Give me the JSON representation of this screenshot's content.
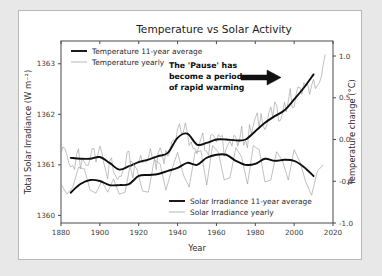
{
  "figure": {
    "title": "Temperature vs Solar Activity",
    "background": "#ffffff",
    "page_background": "#e8e8e8",
    "frame_color": "#b9b9b9"
  },
  "annotation": {
    "line1": "The 'Pause' has",
    "line2": "become a period",
    "line3": "of rapid warming",
    "arrow": "arrow-right",
    "arrow_color": "#111111"
  },
  "legend_top": {
    "items": [
      {
        "label": "Temperature 11-year average",
        "style": "thick",
        "color": "#0f0f0f"
      },
      {
        "label": "Temperature yearly",
        "style": "thin",
        "color": "#9a9a9a"
      }
    ]
  },
  "legend_bottom": {
    "items": [
      {
        "label": "Solar Irradiance 11-year average",
        "style": "thick",
        "color": "#0f0f0f"
      },
      {
        "label": "Solar Irradiance yearly",
        "style": "thin",
        "color": "#9a9a9a"
      }
    ]
  },
  "chart_data": {
    "type": "line",
    "title": "Temperature vs Solar Activity",
    "xlabel": "Year",
    "ylabel": "Total Solar Irradiance (W m$^{-2}$)",
    "ylabel_left": "Total Solar Irradiance (W m⁻²)",
    "ylabel_right": "Temperature change (°C)",
    "grid": false,
    "xlim": [
      1880,
      2020
    ],
    "xticks": [
      1880,
      1900,
      1920,
      1940,
      1960,
      1980,
      2000,
      2020
    ],
    "xticklabels": [
      "1880",
      "1900",
      "1920",
      "1940",
      "1960",
      "1980",
      "2000",
      "2020"
    ],
    "ylim_left": [
      1359.85,
      1363.45
    ],
    "yticks_left": [
      1360,
      1361,
      1362,
      1363
    ],
    "yticklabels_left": [
      "1360",
      "1361",
      "1362",
      "1363"
    ],
    "ylim_right": [
      -1.0,
      1.18
    ],
    "yticks_right": [
      -1.0,
      -0.5,
      0.0,
      0.5,
      1.0
    ],
    "yticklabels_right": [
      "-1.0",
      "-0.5",
      "0.0",
      "0.5",
      "1.0"
    ],
    "legend_position": [
      "upper left",
      "lower right"
    ],
    "series": [
      {
        "name": "Temperature yearly",
        "axis": "right",
        "units": "°C",
        "style": "thin",
        "color": "#9a9a9a",
        "x": [
          1880,
          1881,
          1882,
          1883,
          1884,
          1885,
          1886,
          1887,
          1888,
          1889,
          1890,
          1891,
          1892,
          1893,
          1894,
          1895,
          1896,
          1897,
          1898,
          1899,
          1900,
          1901,
          1902,
          1903,
          1904,
          1905,
          1906,
          1907,
          1908,
          1909,
          1910,
          1911,
          1912,
          1913,
          1914,
          1915,
          1916,
          1917,
          1918,
          1919,
          1920,
          1921,
          1922,
          1923,
          1924,
          1925,
          1926,
          1927,
          1928,
          1929,
          1930,
          1931,
          1932,
          1933,
          1934,
          1935,
          1936,
          1937,
          1938,
          1939,
          1940,
          1941,
          1942,
          1943,
          1944,
          1945,
          1946,
          1947,
          1948,
          1949,
          1950,
          1951,
          1952,
          1953,
          1954,
          1955,
          1956,
          1957,
          1958,
          1959,
          1960,
          1961,
          1962,
          1963,
          1964,
          1965,
          1966,
          1967,
          1968,
          1969,
          1970,
          1971,
          1972,
          1973,
          1974,
          1975,
          1976,
          1977,
          1978,
          1979,
          1980,
          1981,
          1982,
          1983,
          1984,
          1985,
          1986,
          1987,
          1988,
          1989,
          1990,
          1991,
          1992,
          1993,
          1994,
          1995,
          1996,
          1997,
          1998,
          1999,
          2000,
          2001,
          2002,
          2003,
          2004,
          2005,
          2006,
          2007,
          2008,
          2009,
          2010,
          2011,
          2012,
          2013,
          2014,
          2015,
          2016
        ],
        "y": [
          -0.17,
          -0.09,
          -0.11,
          -0.18,
          -0.28,
          -0.33,
          -0.31,
          -0.36,
          -0.18,
          -0.11,
          -0.35,
          -0.23,
          -0.27,
          -0.31,
          -0.31,
          -0.23,
          -0.11,
          -0.11,
          -0.27,
          -0.18,
          -0.08,
          -0.15,
          -0.28,
          -0.37,
          -0.47,
          -0.26,
          -0.22,
          -0.39,
          -0.43,
          -0.48,
          -0.44,
          -0.44,
          -0.36,
          -0.34,
          -0.15,
          -0.14,
          -0.36,
          -0.46,
          -0.29,
          -0.27,
          -0.27,
          -0.19,
          -0.28,
          -0.26,
          -0.27,
          -0.22,
          -0.11,
          -0.22,
          -0.2,
          -0.36,
          -0.16,
          -0.1,
          -0.16,
          -0.29,
          -0.13,
          -0.2,
          -0.15,
          -0.03,
          0.0,
          -0.02,
          0.13,
          0.19,
          0.07,
          0.09,
          0.2,
          0.09,
          -0.07,
          -0.03,
          -0.11,
          -0.11,
          -0.17,
          -0.07,
          0.01,
          0.08,
          -0.13,
          -0.14,
          -0.19,
          0.05,
          0.06,
          0.03,
          -0.03,
          0.06,
          0.03,
          0.05,
          -0.2,
          -0.11,
          -0.06,
          -0.02,
          -0.08,
          0.05,
          0.03,
          -0.08,
          0.01,
          0.16,
          -0.07,
          -0.01,
          -0.1,
          0.18,
          0.07,
          0.17,
          0.26,
          0.32,
          0.14,
          0.31,
          0.16,
          0.12,
          0.18,
          0.32,
          0.39,
          0.27,
          0.45,
          0.41,
          0.22,
          0.23,
          0.31,
          0.45,
          0.33,
          0.46,
          0.61,
          0.38,
          0.39,
          0.54,
          0.63,
          0.62,
          0.54,
          0.68,
          0.64,
          0.66,
          0.54,
          0.65,
          0.72,
          0.61,
          0.65,
          0.68,
          0.75,
          0.9,
          1.02
        ]
      },
      {
        "name": "Temperature 11-year average",
        "axis": "right",
        "units": "°C",
        "style": "thick",
        "color": "#0f0f0f",
        "x": [
          1885,
          1890,
          1895,
          1900,
          1905,
          1910,
          1915,
          1920,
          1925,
          1930,
          1935,
          1940,
          1945,
          1950,
          1955,
          1960,
          1965,
          1970,
          1975,
          1980,
          1985,
          1990,
          1995,
          2000,
          2005,
          2010
        ],
        "y": [
          -0.22,
          -0.23,
          -0.23,
          -0.21,
          -0.28,
          -0.36,
          -0.32,
          -0.27,
          -0.24,
          -0.2,
          -0.16,
          0.02,
          0.07,
          -0.06,
          -0.04,
          0.0,
          0.0,
          -0.01,
          0.0,
          0.1,
          0.2,
          0.28,
          0.35,
          0.48,
          0.62,
          0.78
        ]
      },
      {
        "name": "Solar Irradiance yearly",
        "axis": "left",
        "units": "W m-2",
        "style": "thin",
        "color": "#9a9a9a",
        "x": [
          1880,
          1883,
          1886,
          1889,
          1892,
          1895,
          1898,
          1901,
          1904,
          1907,
          1910,
          1913,
          1916,
          1919,
          1922,
          1925,
          1928,
          1931,
          1934,
          1937,
          1940,
          1943,
          1946,
          1949,
          1952,
          1955,
          1958,
          1961,
          1964,
          1967,
          1970,
          1973,
          1976,
          1979,
          1982,
          1985,
          1988,
          1991,
          1994,
          1997,
          2000,
          2003,
          2006,
          2009,
          2012,
          2015
        ],
        "y": [
          1360.62,
          1360.42,
          1360.55,
          1360.95,
          1360.92,
          1360.5,
          1360.44,
          1360.68,
          1360.46,
          1360.72,
          1360.42,
          1360.46,
          1361.08,
          1360.92,
          1360.48,
          1360.46,
          1361.1,
          1361.02,
          1360.5,
          1360.9,
          1361.25,
          1360.8,
          1360.56,
          1361.25,
          1361.28,
          1360.6,
          1361.38,
          1361.25,
          1360.7,
          1360.75,
          1361.34,
          1361.15,
          1360.62,
          1361.38,
          1361.3,
          1360.66,
          1360.7,
          1361.26,
          1361.08,
          1360.7,
          1361.3,
          1361.06,
          1360.66,
          1360.4,
          1360.88,
          1361.0
        ]
      },
      {
        "name": "Solar Irradiance 11-year average",
        "axis": "left",
        "units": "W m-2",
        "style": "thick",
        "color": "#0f0f0f",
        "x": [
          1885,
          1890,
          1895,
          1900,
          1905,
          1910,
          1915,
          1920,
          1925,
          1930,
          1935,
          1940,
          1945,
          1950,
          1955,
          1960,
          1965,
          1970,
          1975,
          1980,
          1985,
          1990,
          1995,
          2000,
          2005,
          2010
        ],
        "y": [
          1360.45,
          1360.62,
          1360.7,
          1360.68,
          1360.6,
          1360.6,
          1360.62,
          1360.78,
          1360.8,
          1360.82,
          1360.88,
          1360.94,
          1361.04,
          1361.0,
          1361.14,
          1361.2,
          1361.2,
          1361.08,
          1361.0,
          1361.02,
          1361.12,
          1361.08,
          1361.1,
          1361.08,
          1360.96,
          1360.78
        ]
      }
    ]
  }
}
